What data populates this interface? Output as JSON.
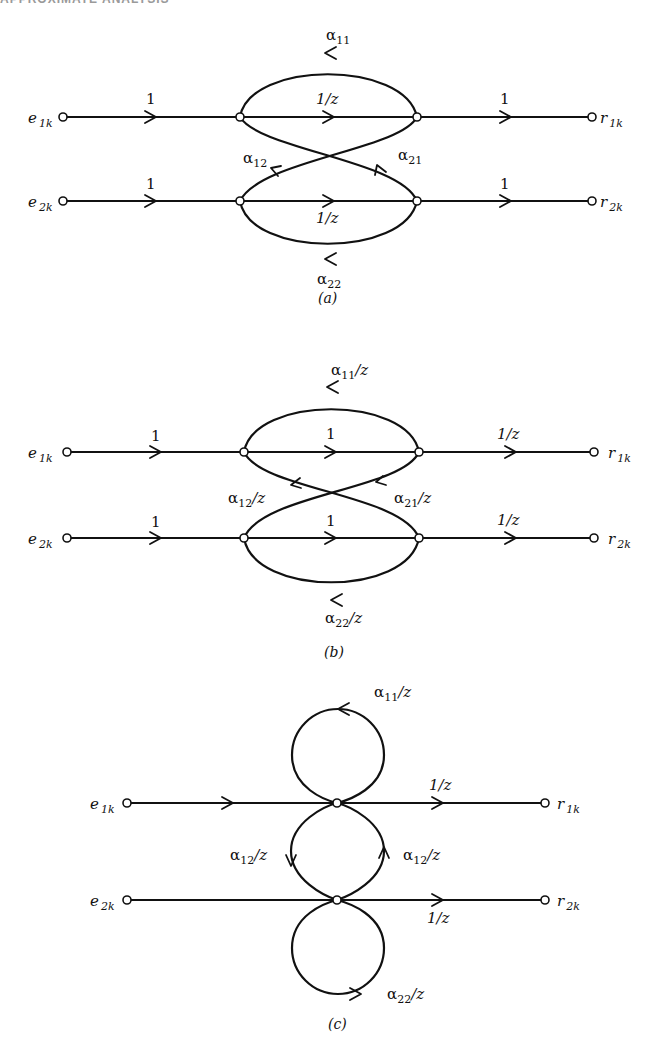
{
  "header": {
    "text": "APPROXIMATE ANALYSIS"
  },
  "colors": {
    "ink": "#111111",
    "background": "#ffffff",
    "node_fill": "#ffffff"
  },
  "icons": {
    "node": "open-circle",
    "arrow": "chevron-arrowhead"
  },
  "figures": [
    {
      "id": "a",
      "caption": "(a)",
      "inputs": [
        {
          "name": "e",
          "sub": "1k"
        },
        {
          "name": "e",
          "sub": "2k"
        }
      ],
      "outputs": [
        {
          "name": "r",
          "sub": "1k"
        },
        {
          "name": "r",
          "sub": "2k"
        }
      ],
      "labels": {
        "in1": "1",
        "in2": "1",
        "mid1": "1/z",
        "mid2": "1/z",
        "out1": "1",
        "out2": "1",
        "a11": "α",
        "a11_sub": "11",
        "a12": "α",
        "a12_sub": "12",
        "a21": "α",
        "a21_sub": "21",
        "a22": "α",
        "a22_sub": "22"
      }
    },
    {
      "id": "b",
      "caption": "(b)",
      "inputs": [
        {
          "name": "e",
          "sub": "1k"
        },
        {
          "name": "e",
          "sub": "2k"
        }
      ],
      "outputs": [
        {
          "name": "r",
          "sub": "1k"
        },
        {
          "name": "r",
          "sub": "2k"
        }
      ],
      "labels": {
        "in1": "1",
        "in2": "1",
        "mid1": "1",
        "mid2": "1",
        "out1": "1/z",
        "out2": "1/z",
        "a11": "α",
        "a11_sub": "11",
        "a11_suf": "/z",
        "a12": "α",
        "a12_sub": "12",
        "a12_suf": "/z",
        "a21": "α",
        "a21_sub": "21",
        "a21_suf": "/z",
        "a22": "α",
        "a22_sub": "22",
        "a22_suf": "/z"
      }
    },
    {
      "id": "c",
      "caption": "(c)",
      "inputs": [
        {
          "name": "e",
          "sub": "1k"
        },
        {
          "name": "e",
          "sub": "2k"
        }
      ],
      "outputs": [
        {
          "name": "r",
          "sub": "1k"
        },
        {
          "name": "r",
          "sub": "2k"
        }
      ],
      "labels": {
        "out1": "1/z",
        "out2": "1/z",
        "a11": "α",
        "a11_sub": "11",
        "a11_suf": "/z",
        "a12_left": "α",
        "a12_left_sub": "12",
        "a12_left_suf": "/z",
        "a12_right": "α",
        "a12_right_sub": "12",
        "a12_right_suf": "/z",
        "a22": "α",
        "a22_sub": "22",
        "a22_suf": "/z"
      }
    }
  ]
}
